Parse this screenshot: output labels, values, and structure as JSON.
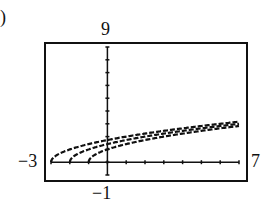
{
  "chart_data": {
    "type": "line",
    "title": "",
    "xlabel": "",
    "ylabel": "",
    "xlim": [
      -3,
      7
    ],
    "ylim": [
      -1,
      9
    ],
    "window_labels": {
      "ymax": "9",
      "ymin": "−1",
      "xmin": "−3",
      "xmax": "7"
    },
    "grid": false,
    "ticks": {
      "x_step": 1,
      "y_step": 1
    },
    "series": [
      {
        "name": "y = sqrt(x+3)",
        "x": [
          -3,
          -2,
          -1,
          0,
          1,
          3,
          5,
          7
        ],
        "values": [
          0,
          1,
          1.41,
          1.73,
          2,
          2.45,
          2.83,
          3.16
        ]
      },
      {
        "name": "y = sqrt(x+2)",
        "x": [
          -2,
          -1,
          0,
          1,
          3,
          5,
          7
        ],
        "values": [
          0,
          1,
          1.41,
          1.73,
          2.24,
          2.65,
          3
        ]
      },
      {
        "name": "y = sqrt(x+1)",
        "x": [
          -1,
          0,
          1,
          3,
          5,
          7
        ],
        "values": [
          0,
          1,
          1.41,
          2,
          2.45,
          2.83
        ]
      }
    ]
  },
  "labels": {
    "ymax": "9",
    "ymin": "−1",
    "xmin": "−3",
    "xmax": "7",
    "corner": ")"
  }
}
